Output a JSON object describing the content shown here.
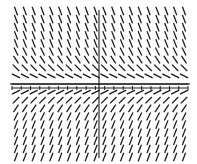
{
  "figure": {
    "kind": "slope-field",
    "title": "",
    "background_color": "#ffffff",
    "segment_color": "#171717",
    "axis_color": "#1a1a1a"
  },
  "chart_data": {
    "type": "scatter",
    "title": "",
    "subtitle": "",
    "xlabel": "",
    "ylabel": "",
    "grid": false,
    "legend": null,
    "annotations": [],
    "plot_kind": "slope-field",
    "xlim": [
      -10,
      10
    ],
    "ylim": [
      -9,
      9
    ],
    "x_tick_labels": [],
    "y_tick_labels": [],
    "grid_columns": 20,
    "grid_rows": 19,
    "x_axis_pixel_y": 84,
    "secondary_axis_pixel_y": 88,
    "y_axis_pixel_x": 99,
    "field_bounds_px": {
      "left": 16,
      "right": 184,
      "top": 11,
      "bottom": 157
    },
    "slope_rule": "slope = -k * (y_pixel_offset) ; sign flips across the horizontal axis, magnitude grows with |y|",
    "slope_scale": 0.062,
    "segment_length_px": 9,
    "tick_count": 20,
    "tick_length_px": 4,
    "series": [
      {
        "name": "direction-field",
        "values": []
      }
    ]
  },
  "axes": {
    "x_axis": {
      "name": "horizontal-axis",
      "y_px": 84,
      "x_start_px": 10,
      "x_end_px": 190
    },
    "x_axis_ticks_row": {
      "name": "tick-row",
      "y_px": 88,
      "x_start_px": 12,
      "x_end_px": 188
    },
    "y_axis": {
      "name": "vertical-axis",
      "x_px": 99,
      "y_start_px": 10,
      "y_end_px": 158
    }
  }
}
